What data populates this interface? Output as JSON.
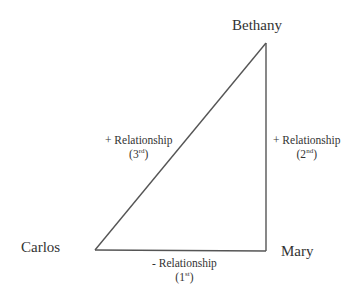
{
  "diagram": {
    "type": "triangle relationship diagram",
    "nodes": [
      {
        "id": "bethany",
        "label": "Bethany"
      },
      {
        "id": "carlos",
        "label": "Carlos"
      },
      {
        "id": "mary",
        "label": "Mary"
      }
    ],
    "edges": [
      {
        "from": "carlos",
        "to": "mary",
        "sign": "-",
        "label": "- Relationship",
        "order_num": "(1",
        "order_sup": "st",
        "order_close": ")"
      },
      {
        "from": "mary",
        "to": "bethany",
        "sign": "+",
        "label": "+ Relationship",
        "order_num": "(2",
        "order_sup": "nd",
        "order_close": ")"
      },
      {
        "from": "carlos",
        "to": "bethany",
        "sign": "+",
        "label": "+ Relationship",
        "order_num": "(3",
        "order_sup": "rd",
        "order_close": ")"
      }
    ],
    "line_color": "#555555"
  }
}
